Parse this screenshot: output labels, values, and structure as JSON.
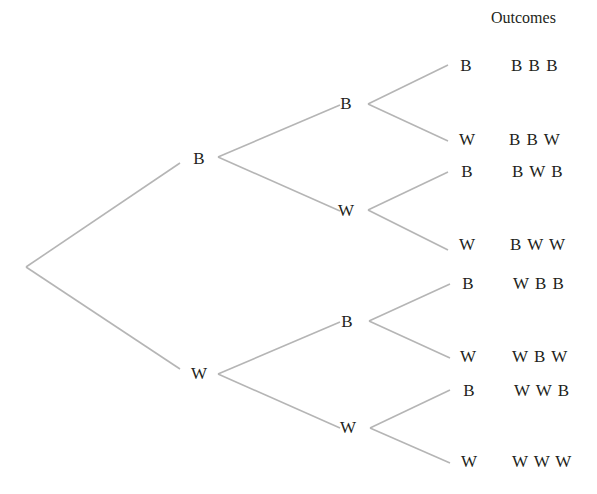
{
  "header": {
    "outcomes_label": "Outcomes"
  },
  "colors": {
    "line": "#b5b5b5",
    "text": "#231f20",
    "background": "#ffffff"
  },
  "tree": {
    "root": {
      "x": 26,
      "y": 267
    },
    "level1": [
      {
        "label": "B",
        "x": 199,
        "y": 159,
        "in": [
          180,
          163
        ],
        "out": [
          218,
          157
        ]
      },
      {
        "label": "W",
        "x": 199,
        "y": 374,
        "in": [
          180,
          369
        ],
        "out": [
          218,
          374
        ]
      }
    ],
    "level2": [
      {
        "label": "B",
        "x": 346,
        "y": 104,
        "in": [
          340,
          105
        ],
        "out": [
          368,
          104
        ]
      },
      {
        "label": "W",
        "x": 346,
        "y": 211,
        "in": [
          340,
          211
        ],
        "out": [
          368,
          210
        ]
      },
      {
        "label": "B",
        "x": 347,
        "y": 322,
        "in": [
          340,
          322
        ],
        "out": [
          369,
          321
        ]
      },
      {
        "label": "W",
        "x": 348,
        "y": 428,
        "in": [
          340,
          428
        ],
        "out": [
          370,
          428
        ]
      }
    ],
    "level3": [
      {
        "label": "B",
        "x": 466,
        "y": 66,
        "in": [
          448,
          65
        ]
      },
      {
        "label": "W",
        "x": 467,
        "y": 140,
        "in": [
          448,
          141
        ]
      },
      {
        "label": "B",
        "x": 467,
        "y": 172,
        "in": [
          448,
          172
        ]
      },
      {
        "label": "W",
        "x": 467,
        "y": 245,
        "in": [
          448,
          250
        ]
      },
      {
        "label": "B",
        "x": 468,
        "y": 284,
        "in": [
          450,
          284
        ]
      },
      {
        "label": "W",
        "x": 468,
        "y": 357,
        "in": [
          450,
          358
        ]
      },
      {
        "label": "B",
        "x": 469,
        "y": 391,
        "in": [
          450,
          390
        ]
      },
      {
        "label": "W",
        "x": 469,
        "y": 462,
        "in": [
          450,
          463
        ]
      }
    ]
  },
  "outcomes": [
    {
      "text": "B B B",
      "x": 511,
      "y": 66
    },
    {
      "text": "B B W",
      "x": 509,
      "y": 140
    },
    {
      "text": "B W B",
      "x": 512,
      "y": 172
    },
    {
      "text": "B W W",
      "x": 510,
      "y": 245
    },
    {
      "text": "W B B",
      "x": 513,
      "y": 284
    },
    {
      "text": "W B W",
      "x": 512,
      "y": 357
    },
    {
      "text": "W W B",
      "x": 514,
      "y": 391
    },
    {
      "text": "W W W",
      "x": 512,
      "y": 462
    }
  ]
}
